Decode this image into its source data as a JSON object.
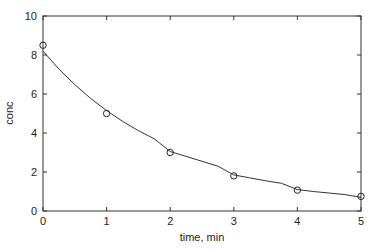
{
  "chart_data": {
    "type": "line",
    "title": "",
    "xlabel": "time, min",
    "ylabel": "conc",
    "xlim": [
      0,
      5
    ],
    "ylim": [
      0,
      10
    ],
    "xticks": [
      0,
      1,
      2,
      3,
      4,
      5
    ],
    "yticks": [
      0,
      2,
      4,
      6,
      8,
      10
    ],
    "grid": false,
    "legend": null,
    "series": [
      {
        "name": "measured",
        "style": "markers-circle",
        "x": [
          0,
          1,
          2,
          3,
          4,
          5
        ],
        "y": [
          8.5,
          5.0,
          3.0,
          1.8,
          1.07,
          0.75
        ]
      },
      {
        "name": "fit",
        "style": "line",
        "x": [
          0,
          0.25,
          0.5,
          0.75,
          1,
          1.25,
          1.5,
          1.75,
          2,
          2.25,
          2.5,
          2.75,
          3,
          3.25,
          3.5,
          3.75,
          4,
          4.25,
          4.5,
          4.75,
          5
        ],
        "y": [
          8.2,
          7.28,
          6.48,
          5.77,
          5.15,
          4.6,
          4.12,
          3.7,
          3.05,
          2.8,
          2.55,
          2.3,
          1.85,
          1.7,
          1.55,
          1.42,
          1.1,
          1.0,
          0.92,
          0.84,
          0.7
        ]
      }
    ]
  }
}
